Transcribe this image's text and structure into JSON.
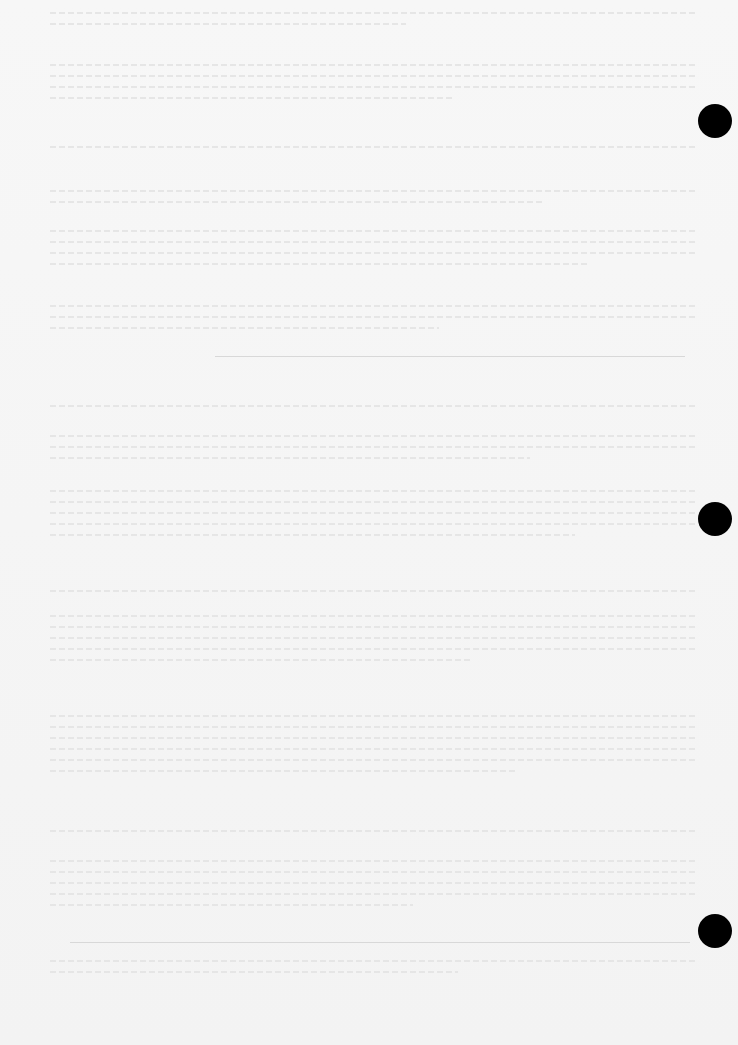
{
  "document": {
    "type": "faded typewritten page (text illegible)",
    "text_legible": false,
    "punch_holes": 3,
    "paragraph_blocks": [
      {
        "top": 12,
        "lines": 2
      },
      {
        "top": 64,
        "lines": 4
      },
      {
        "top": 146,
        "lines": 1
      },
      {
        "top": 190,
        "lines": 2
      },
      {
        "top": 230,
        "lines": 4
      },
      {
        "top": 305,
        "lines": 3
      },
      {
        "top": 405,
        "lines": 1
      },
      {
        "top": 435,
        "lines": 3
      },
      {
        "top": 490,
        "lines": 5
      },
      {
        "top": 590,
        "lines": 1
      },
      {
        "top": 615,
        "lines": 5
      },
      {
        "top": 715,
        "lines": 6
      },
      {
        "top": 830,
        "lines": 1
      },
      {
        "top": 860,
        "lines": 5
      },
      {
        "top": 960,
        "lines": 2
      }
    ],
    "rules": [
      {
        "top": 356,
        "left": 215,
        "width": 470
      },
      {
        "top": 942,
        "left": 70,
        "width": 620
      }
    ]
  }
}
